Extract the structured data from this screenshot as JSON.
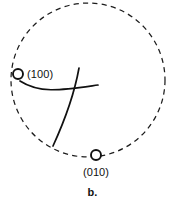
{
  "figure": {
    "caption": "b.",
    "background_color": "#ffffff",
    "line_color": "#111111",
    "dash_color": "#1c1c1c"
  },
  "primitive": {
    "name": "primitive-circle",
    "center_x": 88,
    "center_y": 80,
    "radius": 77,
    "style": "dashed"
  },
  "poles": [
    {
      "label": "(100)",
      "marker_x": 18,
      "marker_y": 74,
      "marker_r": 5,
      "label_x": 27,
      "label_y": 74
    },
    {
      "label": "(010)",
      "marker_x": 96,
      "marker_y": 155,
      "marker_r": 5,
      "label_x": 96,
      "label_y": 172
    }
  ],
  "traces": [
    {
      "name": "near-horizontal-trace",
      "path": "M 20,81 C 40,94 62,90 98,85"
    },
    {
      "name": "near-vertical-trace",
      "path": "M 79,68 C 74,96 64,122 53,146"
    }
  ],
  "chart_data": {
    "type": "scatter",
    "title": "b.",
    "xlabel": "",
    "ylabel": "",
    "categories": [
      "(100)",
      "(010)"
    ],
    "series": [
      {
        "name": "poles",
        "points": [
          {
            "label": "(100)",
            "x": 18,
            "y": 74
          },
          {
            "label": "(010)",
            "x": 96,
            "y": 155
          }
        ]
      }
    ],
    "annotations": [
      "(100)",
      "(010)",
      "b."
    ],
    "grid": false,
    "legend": "none"
  }
}
